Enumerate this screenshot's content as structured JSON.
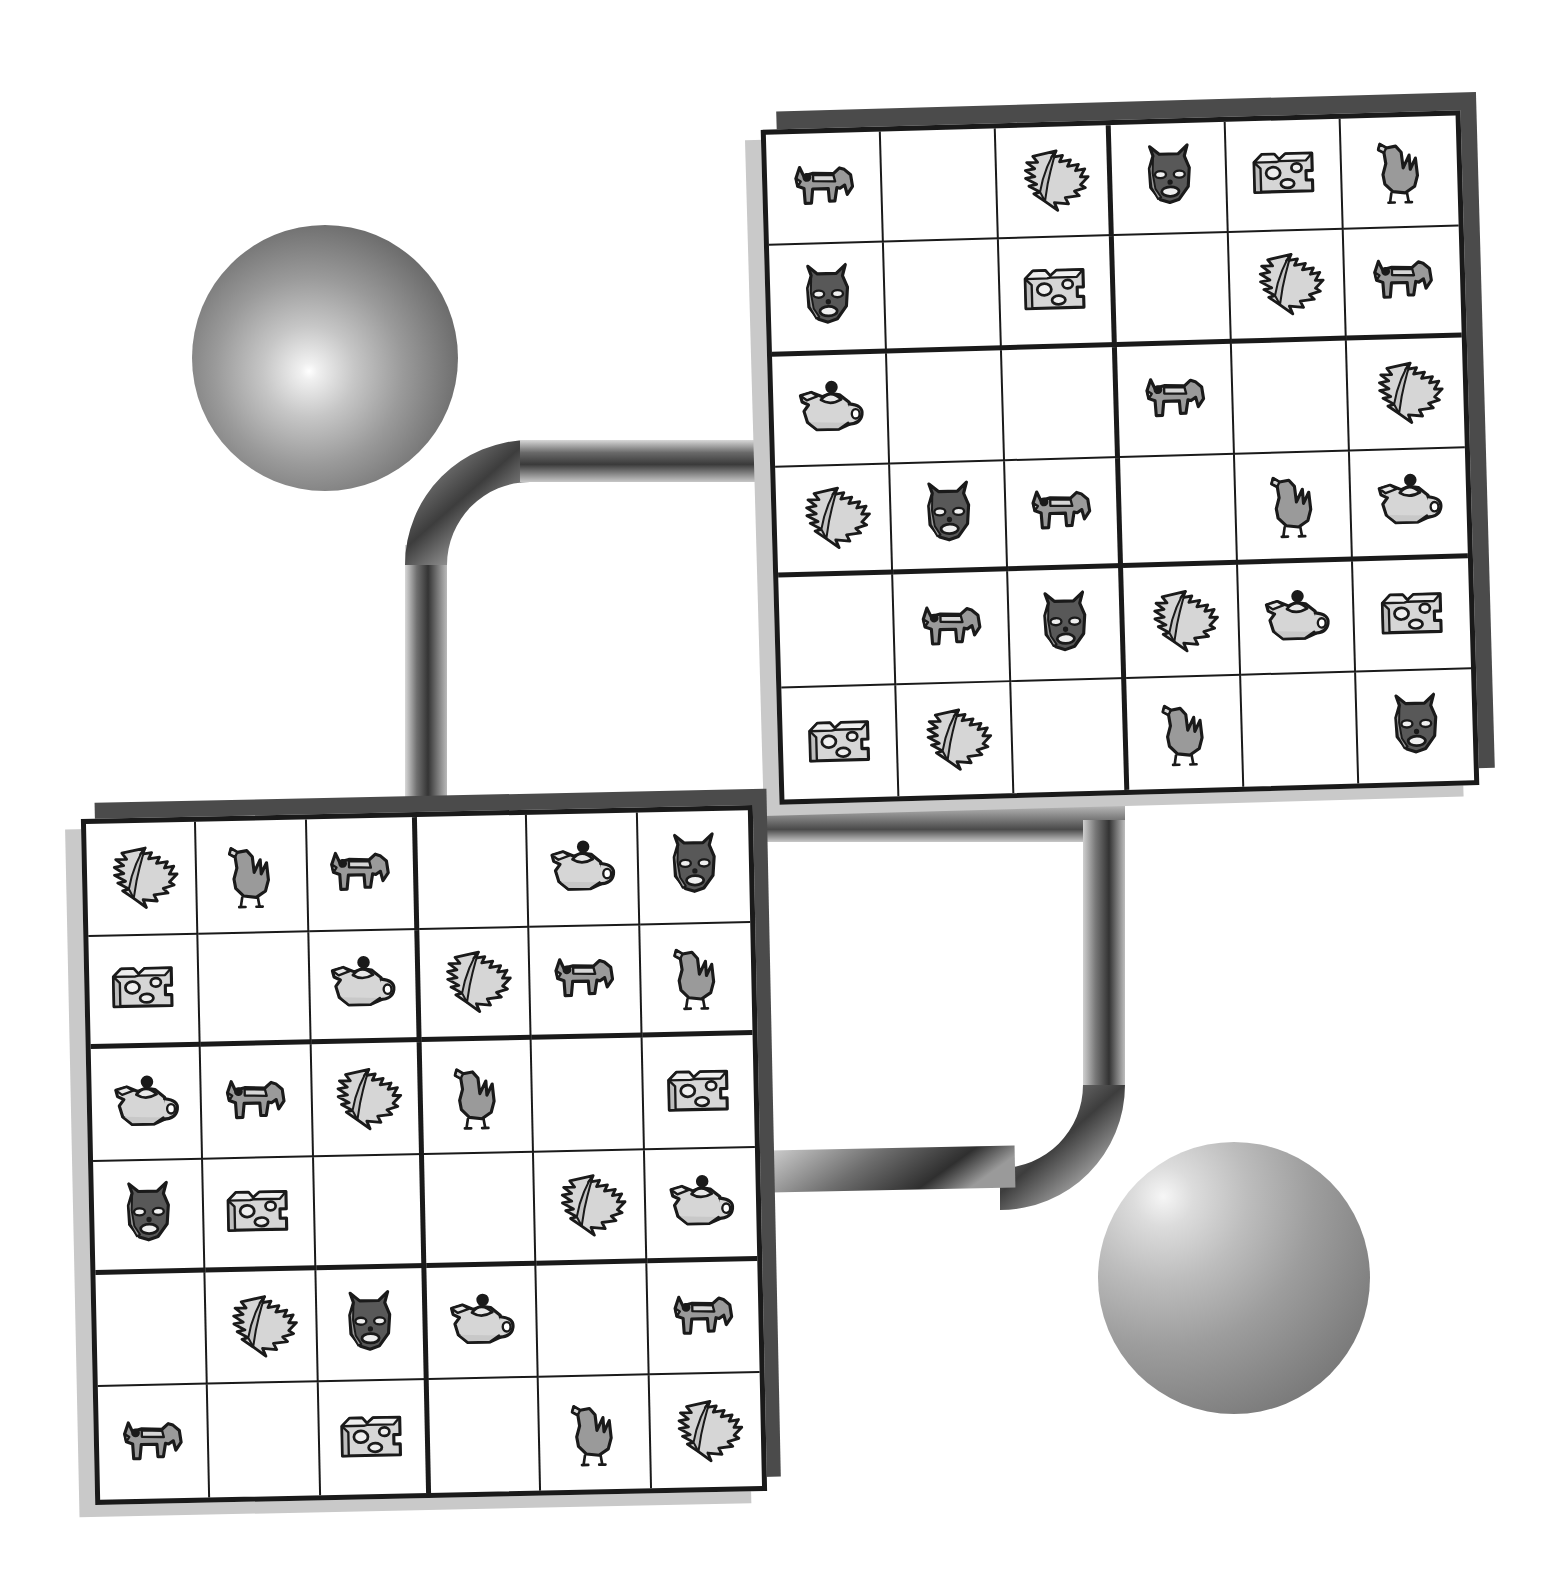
{
  "scene": {
    "title": "Abstract icon grids with connecting ribbons and spheres",
    "background_color": "#ffffff",
    "ink_color": "#1a1a1a",
    "icon_fill_mid": "#9a9a9a",
    "icon_fill_light": "#d6d6d6",
    "icon_fill_dark": "#585858",
    "shadow_dark": "#4b4b4b",
    "shadow_light": "#c9c9c9"
  },
  "icon_legend": {
    "dog": "dog-icon",
    "mask": "cat-mask-icon",
    "cheese": "cheese-wedge-icon",
    "bird": "duck-icon",
    "leaf": "serrated-leaf-icon",
    "teapot": "teapot-icon",
    "empty": "empty-cell"
  },
  "boards": [
    {
      "name": "top-right-grid",
      "rows": 6,
      "cols": 6,
      "rotation_deg": -1.6,
      "left": 770,
      "top": 120,
      "width": 700,
      "height": 675,
      "cells": [
        [
          "dog",
          "empty",
          "leaf",
          "mask",
          "cheese",
          "bird"
        ],
        [
          "mask",
          "empty",
          "cheese",
          "empty",
          "leaf",
          "dog"
        ],
        [
          "teapot",
          "empty",
          "empty",
          "dog",
          "empty",
          "leaf"
        ],
        [
          "leaf",
          "mask",
          "dog",
          "empty",
          "bird",
          "teapot"
        ],
        [
          "empty",
          "dog",
          "mask",
          "leaf",
          "teapot",
          "cheese"
        ],
        [
          "cheese",
          "leaf",
          "empty",
          "bird",
          "empty",
          "mask"
        ]
      ]
    },
    {
      "name": "bottom-left-grid",
      "rows": 6,
      "cols": 6,
      "rotation_deg": -1.2,
      "left": 88,
      "top": 812,
      "width": 672,
      "height": 686,
      "cells": [
        [
          "leaf",
          "bird",
          "dog",
          "empty",
          "teapot",
          "mask"
        ],
        [
          "cheese",
          "empty",
          "teapot",
          "leaf",
          "dog",
          "bird"
        ],
        [
          "teapot",
          "dog",
          "leaf",
          "bird",
          "empty",
          "cheese"
        ],
        [
          "mask",
          "cheese",
          "empty",
          "empty",
          "leaf",
          "teapot"
        ],
        [
          "empty",
          "leaf",
          "mask",
          "teapot",
          "empty",
          "dog"
        ],
        [
          "dog",
          "empty",
          "cheese",
          "empty",
          "bird",
          "leaf"
        ]
      ]
    }
  ],
  "spheres": [
    {
      "name": "sphere-top-left",
      "cx": 325,
      "cy": 358,
      "r": 133,
      "highlight_x_pct": 44,
      "highlight_y_pct": 55,
      "highlight_color": "#f2f2f2",
      "edge_color": "#4f4f4f"
    },
    {
      "name": "sphere-bottom-right",
      "cx": 1234,
      "cy": 1278,
      "r": 136,
      "highlight_x_pct": 24,
      "highlight_y_pct": 20,
      "highlight_color": "#ececec",
      "edge_color": "#6b6b6b"
    }
  ],
  "ribbons": [
    {
      "name": "ribbon-upper",
      "description": "band from top-left sphere area rising right then into left edge of top-right grid",
      "thickness": 40,
      "dark_color": "#3a3a3a",
      "light_color": "#cfcfcf"
    },
    {
      "name": "ribbon-lower",
      "description": "band from right edge of bottom-left grid going right, down, then right toward bottom-right sphere",
      "thickness": 40,
      "dark_color": "#3a3a3a",
      "light_color": "#cfcfcf"
    }
  ]
}
